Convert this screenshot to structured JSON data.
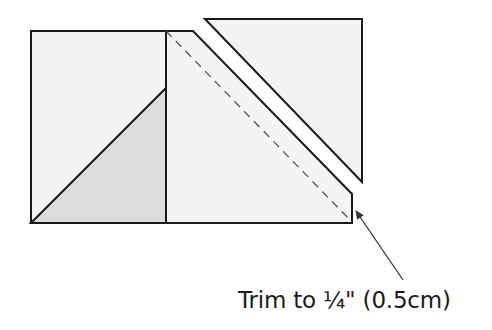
{
  "diagram": {
    "caption": "Trim to ¼\" (0.5cm)",
    "colors": {
      "background": "#ffffff",
      "fabric_light": "#f4f4f4",
      "fabric_shaded": "#dcdcdc",
      "stroke": "#1a1a1a",
      "dashed_line": "#555555",
      "arrow": "#333333"
    },
    "shapes": {
      "left_rectangle": {
        "points": "31,31 166,31 166,223 31,223"
      },
      "shaded_triangle": {
        "points": "31,223 166,88 166,223"
      },
      "right_trimmed_piece": {
        "points": "166,31 193,31 352,194 352,223 166,223"
      },
      "cut_off_triangle": {
        "points": "205,19 362,19 362,182"
      },
      "trim_guide_dashed_line": {
        "x1": 166,
        "y1": 31,
        "x2": 352,
        "y2": 222
      },
      "arrow": {
        "x1": 403,
        "y1": 280,
        "x2": 355,
        "y2": 210
      }
    }
  }
}
